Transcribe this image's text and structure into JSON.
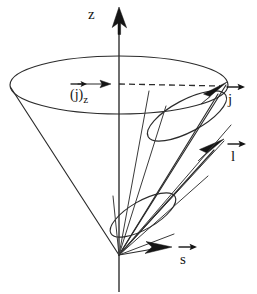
{
  "figure": {
    "background_color": "#ffffff",
    "ink_color": "#2b2b2b",
    "width": 257,
    "height": 294
  },
  "axes": {
    "z_axis": {
      "label": "z",
      "arrowhead": "solid-filled-up",
      "orientation": "vertical"
    }
  },
  "labels": {
    "z": "z",
    "j_z_base": "(j)",
    "j_z_sub": "z",
    "j": "j",
    "l": "l",
    "s": "s"
  },
  "vectors": [
    {
      "name": "j",
      "label": "j",
      "description": "total angular momentum, precesses about z axis on large cone",
      "tip": [
        226,
        85
      ],
      "origin": [
        119,
        255
      ],
      "arrow_over_label": true
    },
    {
      "name": "l",
      "label": "l",
      "description": "orbital angular momentum, precesses about j on small cone",
      "tip": [
        222,
        143
      ],
      "origin": [
        119,
        255
      ],
      "arrow_over_label": true
    },
    {
      "name": "s",
      "label": "s",
      "description": "spin angular momentum, precesses about j on small lower cone",
      "tip": [
        170,
        248
      ],
      "origin": [
        119,
        255
      ],
      "arrow_over_label": true
    },
    {
      "name": "j_z",
      "label": "(j)z",
      "description": "z projection of j, drawn as short horizontal arrow with dashed line to j tip",
      "tip": [
        108,
        84
      ],
      "origin": [
        78,
        84
      ],
      "arrow_over_label": true
    }
  ],
  "cones": [
    {
      "name": "precession-cone-of-j-about-z",
      "apex": [
        119,
        255
      ],
      "base_center": [
        119,
        85
      ],
      "base_rx": 109,
      "base_ry": 30
    },
    {
      "name": "precession-cone-of-l-about-j",
      "apex": [
        119,
        255
      ],
      "axis_to": [
        226,
        85
      ],
      "mouth_center": [
        186,
        115
      ]
    },
    {
      "name": "precession-cone-of-s-about-j",
      "apex": [
        119,
        255
      ],
      "axis_to": [
        170,
        248
      ],
      "mouth_center": [
        142,
        214
      ]
    }
  ],
  "dashed_lines": [
    {
      "name": "j-tip-to-z-axis",
      "from": [
        119,
        84
      ],
      "to": [
        222,
        86
      ]
    }
  ]
}
